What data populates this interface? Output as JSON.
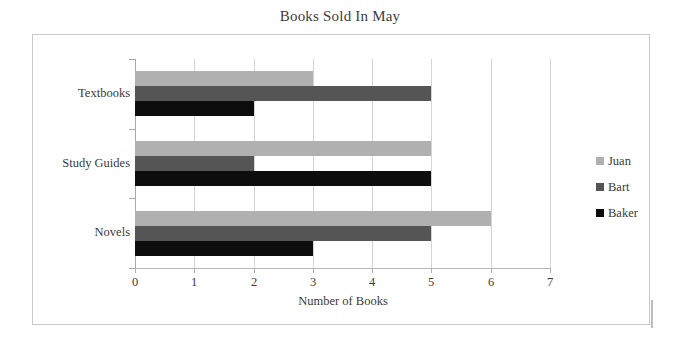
{
  "chart_data": {
    "type": "bar",
    "orientation": "horizontal",
    "title": "Books Sold In May",
    "xlabel": "Number of Books",
    "ylabel": "",
    "categories": [
      "Textbooks",
      "Study Guides",
      "Novels"
    ],
    "series": [
      {
        "name": "Juan",
        "color": "#b0b0b0",
        "values": [
          3,
          5,
          6
        ]
      },
      {
        "name": "Bart",
        "color": "#555555",
        "values": [
          5,
          2,
          5
        ]
      },
      {
        "name": "Baker",
        "color": "#0d0d0d",
        "values": [
          2,
          5,
          3
        ]
      }
    ],
    "xlim": [
      0,
      7
    ],
    "xticks": [
      "0",
      "1",
      "2",
      "3",
      "4",
      "5",
      "6",
      "7"
    ],
    "grid": true,
    "legend_position": "right",
    "legend_entries": [
      "Juan",
      "Bart",
      "Baker"
    ]
  },
  "frame": {
    "border_color": "#c9c9c9",
    "background": "#ffffff"
  }
}
